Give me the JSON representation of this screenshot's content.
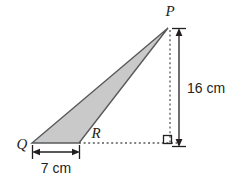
{
  "figure": {
    "type": "geometry-diagram",
    "shape": "triangle",
    "background_color": "#ffffff",
    "fill_color": "#c9c9c9",
    "stroke_color": "#58595b",
    "text_color": "#231f20",
    "vertices": [
      {
        "name": "P",
        "label": "P",
        "x": 168,
        "y": 28,
        "label_x": 170,
        "label_y": 16
      },
      {
        "name": "Q",
        "label": "Q",
        "x": 32,
        "y": 143,
        "label_x": 22,
        "label_y": 147
      },
      {
        "name": "R",
        "label": "R",
        "x": 79,
        "y": 143,
        "label_x": 92,
        "label_y": 137
      }
    ],
    "dimensions": [
      {
        "name": "base-QR",
        "label": "7 cm",
        "orientation": "horizontal",
        "value": 7,
        "unit": "cm",
        "from_x": 33,
        "to_x": 79,
        "line_y": 152,
        "label_x": 56,
        "label_y": 172
      },
      {
        "name": "height-P",
        "label": "16 cm",
        "orientation": "vertical",
        "value": 16,
        "unit": "cm",
        "from_y": 30,
        "to_y": 145,
        "line_x": 179,
        "label_x": 186,
        "label_y": 93
      }
    ],
    "construction_lines": [
      {
        "name": "vertical-dashed-from-P",
        "x1": 170,
        "y1": 30,
        "x2": 170,
        "y2": 143
      },
      {
        "name": "horizontal-dashed-from-R",
        "x1": 79,
        "y1": 143,
        "x2": 176,
        "y2": 143
      }
    ],
    "right_angle": {
      "name": "right-angle-marker",
      "x": 164,
      "y": 136,
      "size": 8
    }
  }
}
